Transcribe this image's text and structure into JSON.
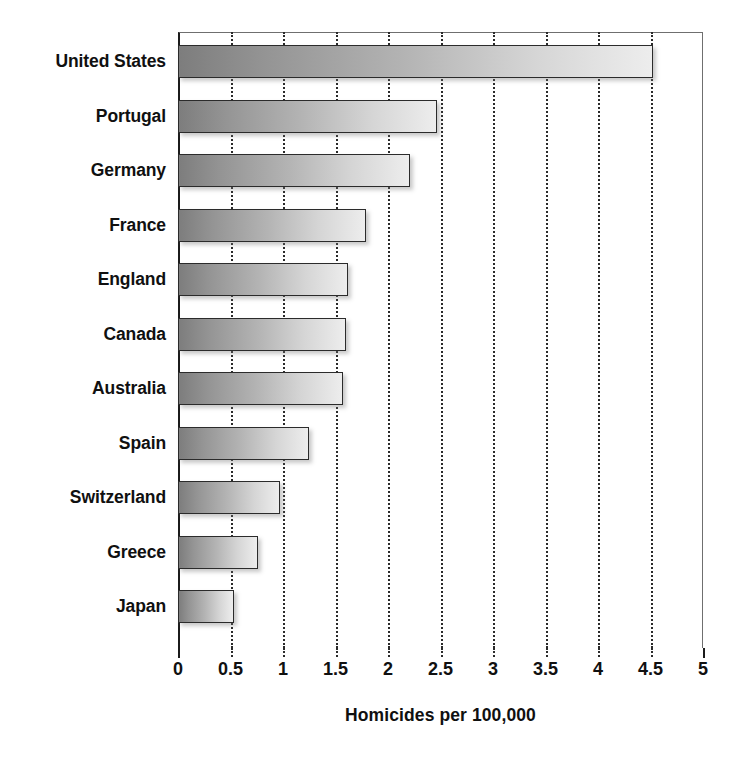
{
  "chart_data": {
    "type": "bar",
    "orientation": "horizontal",
    "title": "",
    "xlabel": "Homicides per 100,000",
    "ylabel": "",
    "xlim": [
      0,
      5
    ],
    "xticks": [
      "0",
      "0.5",
      "1",
      "1.5",
      "2",
      "2.5",
      "3",
      "3.5",
      "4",
      "4.5",
      "5"
    ],
    "xtick_values": [
      0,
      0.5,
      1,
      1.5,
      2,
      2.5,
      3,
      3.5,
      4,
      4.5,
      5
    ],
    "grid": "vertical-dotted",
    "legend": "none",
    "categories": [
      "United States",
      "Portugal",
      "Germany",
      "France",
      "England",
      "Canada",
      "Australia",
      "Spain",
      "Switzerland",
      "Greece",
      "Japan"
    ],
    "values": [
      4.52,
      2.47,
      2.21,
      1.79,
      1.62,
      1.6,
      1.57,
      1.25,
      0.97,
      0.76,
      0.53
    ],
    "bars": [
      {
        "label": "United States",
        "value": 4.52
      },
      {
        "label": "Portugal",
        "value": 2.47
      },
      {
        "label": "Germany",
        "value": 2.21
      },
      {
        "label": "France",
        "value": 1.79
      },
      {
        "label": "England",
        "value": 1.62
      },
      {
        "label": "Canada",
        "value": 1.6
      },
      {
        "label": "Australia",
        "value": 1.57
      },
      {
        "label": "Spain",
        "value": 1.25
      },
      {
        "label": "Switzerland",
        "value": 0.97
      },
      {
        "label": "Greece",
        "value": 0.76
      },
      {
        "label": "Japan",
        "value": 0.53
      }
    ],
    "colors": {
      "bar_gradient_start": "#7d7d7d",
      "bar_gradient_end": "#ededed",
      "bar_outline": "#2b2b2b",
      "gridline": "#2a2a2a",
      "axis": "#1b1b1b",
      "text": "#101010",
      "background": "#ffffff"
    }
  }
}
